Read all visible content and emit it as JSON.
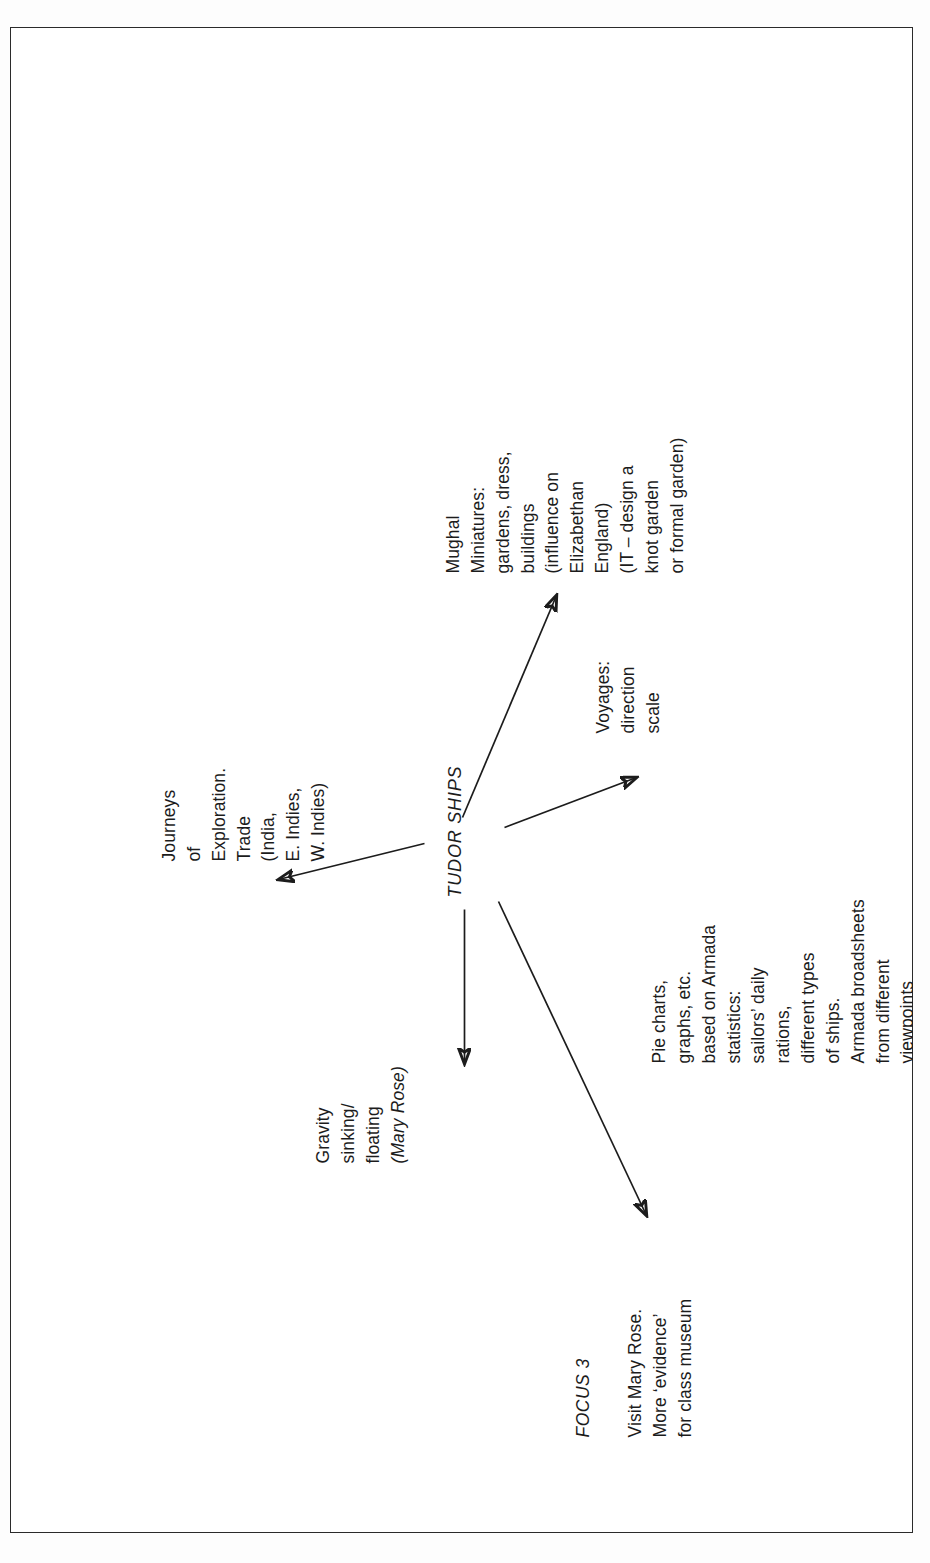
{
  "document": {
    "type": "mind-map",
    "center_label": "TUDOR SHIPS",
    "focus_heading": "FOCUS 3",
    "orientation": "landscape artwork rotated 90 degrees counter-clockwise on a portrait page",
    "ink_color": "#1c1c1c",
    "page_background": "#ffffff",
    "border_color": "#2b2b2b"
  },
  "center": {
    "label": "TUDOR SHIPS"
  },
  "branches": {
    "journeys": {
      "name": "journeys-of-exploration",
      "text": "Journeys\nof\nExploration.\nTrade\n(India,\nE. Indies,\nW. Indies)"
    },
    "gravity": {
      "name": "gravity-sinking-floating",
      "line1": "Gravity",
      "line2": "sinking/",
      "line3": "floating",
      "line4": "(Mary Rose)",
      "text": "Gravity\nsinking/\nfloating\n(Mary Rose)"
    },
    "focus": {
      "name": "focus-heading",
      "heading": "FOCUS 3",
      "text": "Visit Mary Rose.\nMore ‘evidence’\nfor class museum"
    },
    "pie": {
      "name": "pie-charts-statistics",
      "text": "Pie charts,\ngraphs, etc.\nbased on Armada\nstatistics:\nsailors’ daily\nrations,\ndifferent types\nof ships.\nArmada broadsheets\nfrom different\nviewpoints"
    },
    "voyages": {
      "name": "voyages-direction-scale",
      "text": "Voyages:\ndirection\nscale"
    },
    "mughal": {
      "name": "mughal-miniatures",
      "text": "Mughal\nMiniatures:\ngardens, dress,\nbuildings\n(influence on\nElizabethan\nEngland)\n(IT – design a\nknot garden\nor formal garden)"
    }
  },
  "connectors": [
    {
      "name": "link-center-to-journeys",
      "from": "TUDOR SHIPS",
      "to": "Journeys of Exploration",
      "arrowhead": true
    },
    {
      "name": "link-center-to-gravity",
      "from": "TUDOR SHIPS",
      "to": "Gravity sinking/floating",
      "arrowhead": true
    },
    {
      "name": "link-center-to-focus",
      "from": "TUDOR SHIPS",
      "to": "Visit Mary Rose",
      "arrowhead": true
    },
    {
      "name": "link-center-to-pie",
      "from": "TUDOR SHIPS",
      "to": "Pie charts, graphs, etc.",
      "arrowhead": true
    },
    {
      "name": "link-center-to-mughal",
      "from": "TUDOR SHIPS",
      "to": "Mughal Miniatures",
      "arrowhead": true
    }
  ]
}
